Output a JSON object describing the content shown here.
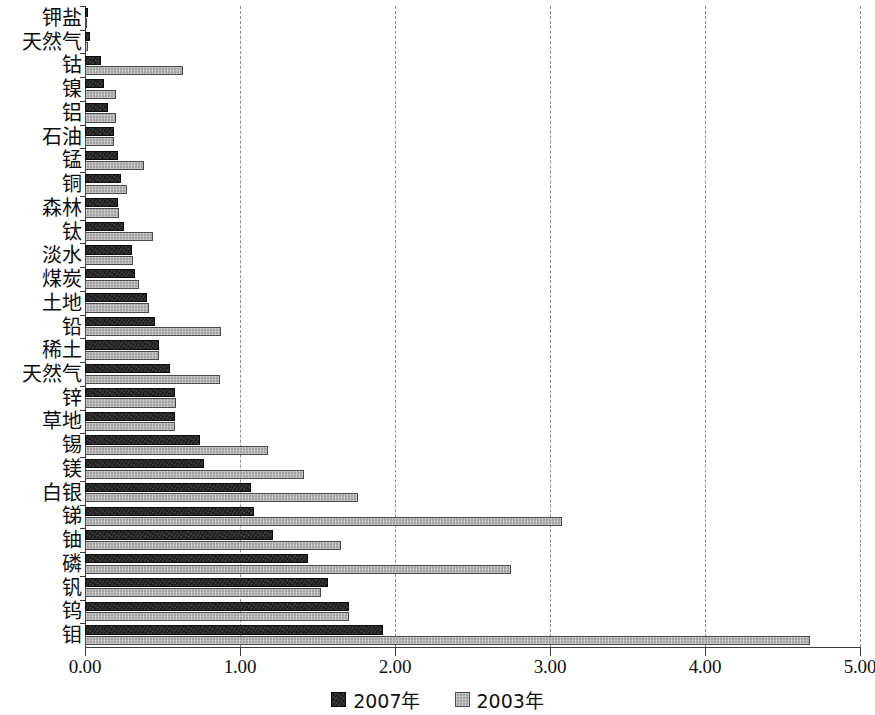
{
  "chart_data": {
    "type": "bar",
    "orientation": "horizontal",
    "title": "",
    "subtitle": "",
    "xlabel": "",
    "ylabel": "",
    "xlim": [
      0.0,
      5.0
    ],
    "xticks": [
      "0.00",
      "1.00",
      "2.00",
      "3.00",
      "4.00",
      "5.00"
    ],
    "xtick_values": [
      0.0,
      1.0,
      2.0,
      3.0,
      4.0,
      5.0
    ],
    "grid": "vertical-dashed",
    "legend_position": "bottom-center",
    "categories": [
      "钾盐",
      "天然气",
      "钴",
      "镍",
      "铝",
      "石油",
      "锰",
      "铜",
      "森林",
      "钛",
      "淡水",
      "煤炭",
      "土地",
      "铅",
      "稀土",
      "天然气",
      "锌",
      "草地",
      "锡",
      "镁",
      "白银",
      "锑",
      "铀",
      "磷",
      "钒",
      "钨",
      "钼"
    ],
    "series": [
      {
        "name": "2007年",
        "color": "#201f1f",
        "values": [
          0.02,
          0.03,
          0.1,
          0.12,
          0.15,
          0.19,
          0.21,
          0.23,
          0.21,
          0.25,
          0.3,
          0.32,
          0.4,
          0.45,
          0.48,
          0.55,
          0.58,
          0.58,
          0.74,
          0.77,
          1.07,
          1.09,
          1.21,
          1.44,
          1.57,
          1.7,
          1.92
        ]
      },
      {
        "name": "2003年",
        "color": "#a3a3a3",
        "values": [
          0.01,
          0.02,
          0.63,
          0.2,
          0.2,
          0.19,
          0.38,
          0.27,
          0.22,
          0.44,
          0.31,
          0.35,
          0.41,
          0.88,
          0.48,
          0.87,
          0.59,
          0.58,
          1.18,
          1.41,
          1.76,
          3.08,
          1.65,
          2.75,
          1.52,
          1.7,
          4.68
        ]
      }
    ]
  },
  "legend": {
    "items": [
      {
        "label": "2007年",
        "swatch_name": "legend-swatch-2007"
      },
      {
        "label": "2003年",
        "swatch_name": "legend-swatch-2003"
      }
    ]
  }
}
